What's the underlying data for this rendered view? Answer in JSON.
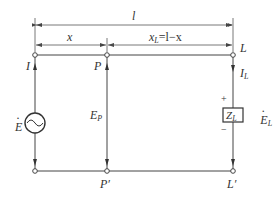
{
  "diagram": {
    "title": "",
    "dimensions": {
      "total_length": "l",
      "segment_x": "x",
      "segment_xl": "x",
      "segment_xl_sub": "L",
      "segment_xl_expr": "=l−x"
    },
    "nodes": {
      "start": "I",
      "p": "P",
      "load": "L",
      "p_prime": "P′",
      "load_prime": "L′"
    },
    "source": {
      "label": "E",
      "type": "ac-source"
    },
    "voltage_p": {
      "label": "E",
      "sub": "P"
    },
    "current_load": {
      "label": "I",
      "sub": "L"
    },
    "impedance": {
      "label": "Z",
      "sub": "L"
    },
    "load_emf": {
      "label": "E",
      "sub": "L"
    },
    "polarity": {
      "plus": "+",
      "minus": "−"
    },
    "colors": {
      "line": "#444444",
      "text": "#333333"
    }
  }
}
